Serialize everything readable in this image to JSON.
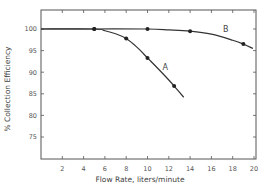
{
  "chart_data": {
    "type": "line",
    "title": "",
    "xlabel": "Flow Rate, liters/minute",
    "ylabel": "% Collection Efficiency",
    "xlim": [
      0,
      20
    ],
    "ylim": [
      70,
      104
    ],
    "grid": false,
    "legend": "inline curve labels",
    "x_ticks": [
      2,
      4,
      6,
      8,
      10,
      12,
      14,
      16,
      18,
      20
    ],
    "x_tick_labels": [
      "2",
      "4",
      "6",
      "8",
      "10",
      "12",
      "14",
      "16",
      "18",
      "20"
    ],
    "y_ticks": [
      75,
      80,
      85,
      90,
      95,
      100
    ],
    "y_tick_labels": [
      "75",
      "80",
      "85",
      "90",
      "95",
      "100"
    ],
    "series": [
      {
        "name": "A",
        "points": [
          [
            5,
            100
          ],
          [
            8,
            97.8
          ],
          [
            10,
            93.3
          ],
          [
            12.5,
            86.8
          ]
        ],
        "curve": [
          [
            0,
            100
          ],
          [
            5,
            100
          ],
          [
            6,
            99.6
          ],
          [
            7,
            98.9
          ],
          [
            8,
            97.8
          ],
          [
            9,
            95.8
          ],
          [
            10,
            93.3
          ],
          [
            11,
            90.8
          ],
          [
            12,
            88.2
          ],
          [
            12.5,
            86.8
          ],
          [
            13.4,
            84.2
          ]
        ],
        "label_position": [
          11.4,
          90.5
        ]
      },
      {
        "name": "B",
        "points": [
          [
            5,
            100
          ],
          [
            10,
            100
          ],
          [
            14,
            99.5
          ],
          [
            19,
            96.5
          ]
        ],
        "curve": [
          [
            0,
            100
          ],
          [
            5,
            100
          ],
          [
            10,
            100
          ],
          [
            12,
            99.8
          ],
          [
            14,
            99.5
          ],
          [
            16,
            98.8
          ],
          [
            18,
            97.4
          ],
          [
            19,
            96.5
          ],
          [
            19.9,
            95.5
          ]
        ],
        "label_position": [
          17.1,
          99.2
        ]
      }
    ]
  }
}
